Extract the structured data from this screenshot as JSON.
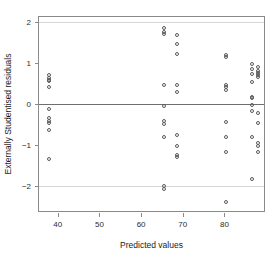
{
  "chart_data": {
    "type": "scatter",
    "title": "",
    "xlabel": "Predicted values",
    "ylabel": "Externally Studentised residuals",
    "xlim": [
      35.5,
      89.5
    ],
    "ylim": [
      -2.62,
      2.12
    ],
    "xticks": [
      40,
      50,
      60,
      70,
      80
    ],
    "yticks": [
      2,
      1,
      0,
      -1,
      -2
    ],
    "grid": false,
    "legend": null,
    "reference_lines": [
      {
        "y": 2,
        "style": "light",
        "color": "#d6d6d6"
      },
      {
        "y": 0,
        "style": "solid",
        "color": "#6e6e6e"
      },
      {
        "y": -2,
        "style": "light",
        "color": "#d6d6d6"
      }
    ],
    "marker": "open-circle",
    "marker_color": "#5a5a5a",
    "points": [
      {
        "x": 37.9,
        "y": 0.71
      },
      {
        "x": 37.9,
        "y": 0.62
      },
      {
        "x": 37.9,
        "y": 0.58
      },
      {
        "x": 37.9,
        "y": 0.55
      },
      {
        "x": 37.9,
        "y": 0.42
      },
      {
        "x": 37.9,
        "y": -0.12
      },
      {
        "x": 37.9,
        "y": -0.34
      },
      {
        "x": 37.9,
        "y": -0.42
      },
      {
        "x": 37.9,
        "y": -0.46
      },
      {
        "x": 37.9,
        "y": -0.65
      },
      {
        "x": 37.9,
        "y": -1.36
      },
      {
        "x": 65.5,
        "y": 1.86
      },
      {
        "x": 65.5,
        "y": 1.76
      },
      {
        "x": 65.5,
        "y": 1.7
      },
      {
        "x": 65.5,
        "y": 0.47
      },
      {
        "x": 65.5,
        "y": -0.06
      },
      {
        "x": 65.5,
        "y": -0.42
      },
      {
        "x": 65.5,
        "y": -0.49
      },
      {
        "x": 65.5,
        "y": -0.81
      },
      {
        "x": 65.5,
        "y": -2.0
      },
      {
        "x": 65.5,
        "y": -2.08
      },
      {
        "x": 68.5,
        "y": 1.68
      },
      {
        "x": 68.5,
        "y": 1.46
      },
      {
        "x": 68.5,
        "y": 1.22
      },
      {
        "x": 68.5,
        "y": 0.45
      },
      {
        "x": 68.5,
        "y": 0.29
      },
      {
        "x": 68.5,
        "y": -0.76
      },
      {
        "x": 68.5,
        "y": -1.02
      },
      {
        "x": 68.5,
        "y": -1.24
      },
      {
        "x": 68.5,
        "y": -1.3
      },
      {
        "x": 80.4,
        "y": 1.19
      },
      {
        "x": 80.4,
        "y": 1.15
      },
      {
        "x": 80.4,
        "y": 0.47
      },
      {
        "x": 80.4,
        "y": 0.4
      },
      {
        "x": 80.4,
        "y": 0.34
      },
      {
        "x": 80.4,
        "y": -0.44
      },
      {
        "x": 80.4,
        "y": -0.8
      },
      {
        "x": 80.4,
        "y": -1.17
      },
      {
        "x": 80.4,
        "y": -2.4
      },
      {
        "x": 86.6,
        "y": 0.96
      },
      {
        "x": 86.6,
        "y": 0.86
      },
      {
        "x": 86.6,
        "y": 0.73
      },
      {
        "x": 86.6,
        "y": 0.54
      },
      {
        "x": 86.6,
        "y": 0.17
      },
      {
        "x": 86.6,
        "y": 0.13
      },
      {
        "x": 86.6,
        "y": -0.03
      },
      {
        "x": 86.6,
        "y": -0.17
      },
      {
        "x": 86.6,
        "y": -0.82
      },
      {
        "x": 86.6,
        "y": -1.84
      },
      {
        "x": 88.1,
        "y": 0.9
      },
      {
        "x": 88.1,
        "y": 0.8
      },
      {
        "x": 88.1,
        "y": 0.75
      },
      {
        "x": 88.1,
        "y": 0.7
      },
      {
        "x": 88.1,
        "y": 0.66
      },
      {
        "x": 88.1,
        "y": -0.22
      },
      {
        "x": 88.1,
        "y": -0.47
      },
      {
        "x": 88.1,
        "y": -0.96
      },
      {
        "x": 88.1,
        "y": -1.02
      },
      {
        "x": 88.1,
        "y": -1.18
      }
    ]
  }
}
